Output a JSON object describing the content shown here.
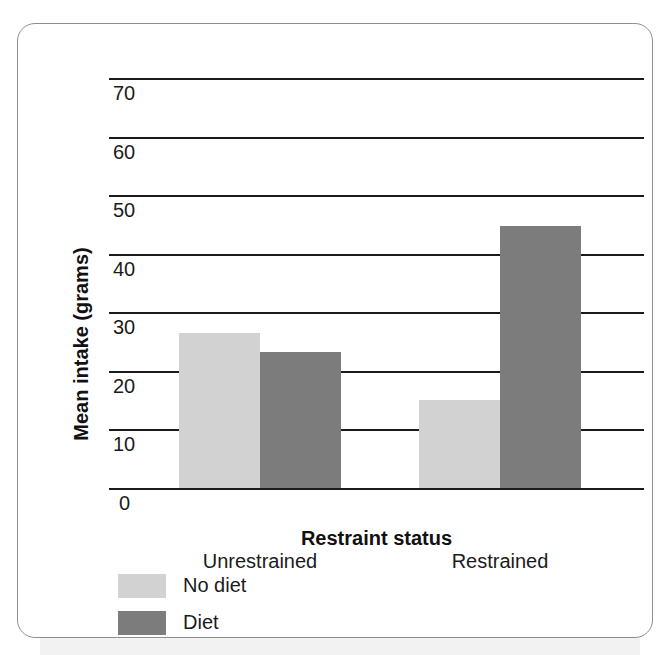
{
  "figure": {
    "frame_border_color": "#8e8e8e",
    "background": "#ffffff"
  },
  "chart_data": {
    "type": "bar",
    "title": "",
    "xlabel": "Restraint status",
    "ylabel": "Mean intake (grams)",
    "categories": [
      "Unrestrained",
      "Restrained"
    ],
    "series": [
      {
        "name": "No diet",
        "color": "#d2d2d2",
        "values": [
          26.5,
          15.1
        ]
      },
      {
        "name": "Diet",
        "color": "#7c7c7c",
        "values": [
          23.2,
          44.7
        ]
      }
    ],
    "ylim": [
      0,
      70
    ],
    "yticks": [
      0,
      10,
      20,
      30,
      40,
      50,
      60,
      70
    ],
    "ytick_labels": [
      "0",
      "10",
      "20",
      "30",
      "40",
      "50",
      "60",
      "70"
    ],
    "grid": true,
    "grid_axis": "y",
    "legend_position": "below-left",
    "bar_gap_between_groups": true
  },
  "axis": {
    "y_labels": {
      "t0": "0",
      "t10": "10",
      "t20": "20",
      "t30": "30",
      "t40": "40",
      "t50": "50",
      "t60": "60",
      "t70": "70"
    },
    "x_labels": {
      "unrestrained": "Unrestrained",
      "restrained": "Restrained"
    },
    "x_title": "Restraint status",
    "y_title": "Mean intake (grams)"
  },
  "legend": {
    "items": [
      {
        "label": "No diet",
        "color": "#d2d2d2"
      },
      {
        "label": "Diet",
        "color": "#7c7c7c"
      }
    ]
  }
}
